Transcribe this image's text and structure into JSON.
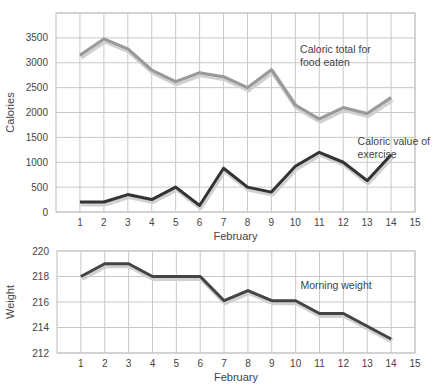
{
  "chart_data": [
    {
      "type": "line",
      "title": "",
      "xlabel": "February",
      "ylabel": "Calories",
      "x": [
        1,
        2,
        3,
        4,
        5,
        6,
        7,
        8,
        9,
        10,
        11,
        12,
        13,
        14
      ],
      "xticks": [
        1,
        2,
        3,
        4,
        5,
        6,
        7,
        8,
        9,
        10,
        11,
        12,
        13,
        14,
        15
      ],
      "yticks": [
        0,
        500,
        1000,
        1500,
        2000,
        2500,
        3000,
        3500
      ],
      "ylim": [
        0,
        4000
      ],
      "xlim": [
        0,
        15
      ],
      "grid": true,
      "series": [
        {
          "name": "Caloric total for food eaten",
          "color": "#999999",
          "values": [
            3150,
            3480,
            3280,
            2850,
            2620,
            2800,
            2720,
            2500,
            2860,
            2150,
            1870,
            2100,
            1980,
            2300
          ]
        },
        {
          "name": "Caloric value of exercise",
          "color": "#333333",
          "values": [
            200,
            200,
            350,
            250,
            500,
            130,
            880,
            500,
            400,
            920,
            1200,
            1000,
            630,
            1150
          ]
        }
      ],
      "annotations": [
        {
          "text": [
            "Caloric total for",
            "food eaten"
          ],
          "x": 10.2,
          "y": 3200
        },
        {
          "text": [
            "Caloric value of",
            "exercise"
          ],
          "x": 12.6,
          "y": 1350
        }
      ]
    },
    {
      "type": "line",
      "title": "",
      "xlabel": "February",
      "ylabel": "Weight",
      "x": [
        1,
        2,
        3,
        4,
        5,
        6,
        7,
        8,
        9,
        10,
        11,
        12,
        13,
        14
      ],
      "xticks": [
        1,
        2,
        3,
        4,
        5,
        6,
        7,
        8,
        9,
        10,
        11,
        12,
        13,
        14,
        15
      ],
      "yticks": [
        212,
        214,
        216,
        218,
        220
      ],
      "ylim": [
        212,
        220
      ],
      "xlim": [
        0,
        15
      ],
      "grid": true,
      "series": [
        {
          "name": "Morning weight",
          "color": "#444444",
          "values": [
            218,
            219,
            219,
            218,
            218,
            218,
            216.1,
            216.9,
            216.1,
            216.1,
            215.1,
            215.1,
            214.1,
            213.1
          ]
        }
      ],
      "annotations": [
        {
          "text": [
            "Morning weight"
          ],
          "x": 10.2,
          "y": 217
        }
      ]
    }
  ]
}
